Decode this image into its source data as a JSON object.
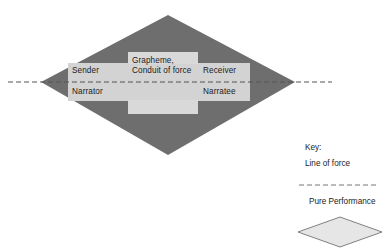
{
  "diagram": {
    "main_shape": {
      "name": "pure-performance-diamond",
      "fill": "#6e6e6e"
    },
    "band": {
      "name": "participant-band",
      "fill": "#d3d3d3"
    },
    "center_box": {
      "name": "grapheme-box",
      "fill": "#d9d9d9"
    },
    "labels": {
      "sender": "Sender",
      "narrator": "Narrator",
      "receiver": "Receiver",
      "narratee": "Narratee",
      "grapheme": "Grapheme,",
      "conduit": "Conduit of force"
    },
    "line_of_force": {
      "name": "line-of-force",
      "color": "#555555",
      "style": "dashed"
    }
  },
  "key": {
    "title": "Key:",
    "line_of_force_label": "Line of force",
    "pure_performance_label": "Pure Performance",
    "sample_line_color": "#777777",
    "sample_diamond_fill": "#e6e6e6",
    "sample_diamond_stroke": "#808080"
  }
}
